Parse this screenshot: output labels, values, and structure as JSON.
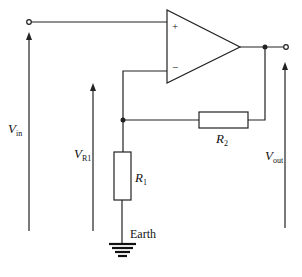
{
  "diagram": {
    "type": "non-inverting op-amp amplifier circuit",
    "opamp": {
      "plus_label": "+",
      "minus_label": "−"
    },
    "resistors": [
      {
        "id": "R1",
        "label": "R",
        "subscript": "1"
      },
      {
        "id": "R2",
        "label": "R",
        "subscript": "2"
      }
    ],
    "voltages": [
      {
        "id": "Vin",
        "label": "V",
        "subscript": "in"
      },
      {
        "id": "VR1",
        "label": "V",
        "subscript": "R1"
      },
      {
        "id": "Vout",
        "label": "V",
        "subscript": "out"
      }
    ],
    "ground": {
      "label": "Earth"
    }
  }
}
